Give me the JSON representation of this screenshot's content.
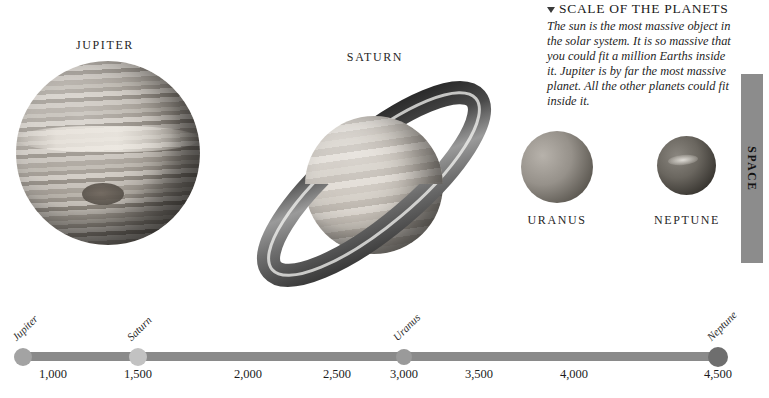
{
  "info_panel": {
    "heading": "SCALE OF THE PLANETS",
    "marker_icon": "triangle-down-icon",
    "body": "The sun is the most massive object in the solar system. It is so massive that you could fit a million Earths inside it. Jupiter is by far the most massive planet. All the other planets could fit inside it."
  },
  "side_tab": {
    "label": "SPACE",
    "color": "#8c8c8c"
  },
  "planets": [
    {
      "name": "JUPITER",
      "label_x": 105,
      "label_y": 38
    },
    {
      "name": "SATURN",
      "label_x": 375,
      "label_y": 50
    },
    {
      "name": "URANUS",
      "label_x": 557,
      "label_y": 213
    },
    {
      "name": "NEPTUNE",
      "label_x": 687,
      "label_y": 213
    }
  ],
  "chart_data": {
    "type": "scatter",
    "title": "",
    "xlabel": "",
    "ylabel": "",
    "xlim": [
      780,
      4780
    ],
    "grid": false,
    "legend": "none",
    "tick_labels": [
      "1,000",
      "1,500",
      "2,000",
      "2,500",
      "3,000",
      "3,500",
      "4,000",
      "4,500"
    ],
    "tick_values": [
      1000,
      1500,
      2000,
      2500,
      3000,
      3500,
      4000,
      4500
    ],
    "tick_x_px": [
      53,
      138,
      248,
      337,
      404,
      479,
      574,
      718
    ],
    "axis_line_color": "#8a8a8a",
    "points": [
      {
        "label": "Jupiter",
        "value": 780,
        "x_px": 23,
        "radius": 9,
        "color": "#a3a3a3"
      },
      {
        "label": "Saturn",
        "value": 1430,
        "x_px": 138,
        "radius": 9,
        "color": "#c2c2c2"
      },
      {
        "label": "Uranus",
        "value": 2870,
        "x_px": 404,
        "radius": 8,
        "color": "#9a9a9a"
      },
      {
        "label": "Neptune",
        "value": 4500,
        "x_px": 718,
        "radius": 10,
        "color": "#6e6e6e"
      }
    ]
  }
}
